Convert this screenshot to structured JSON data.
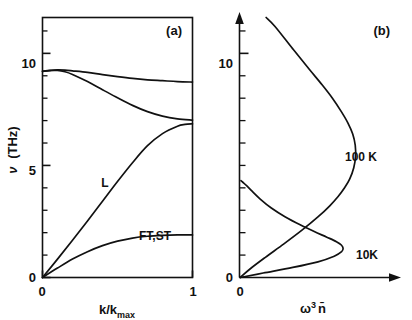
{
  "figure": {
    "background": "#ffffff",
    "ink": "#111111",
    "width": 412,
    "height": 320
  },
  "panel_a": {
    "label": "(a)",
    "xlabel_main": "k/k",
    "xlabel_sub": "max",
    "ylabel_symbol": "ν",
    "ylabel_unit": "(THz)",
    "x_ticks": [
      "0",
      "1"
    ],
    "y_ticks": [
      "0",
      "5",
      "10"
    ],
    "curve_labels": {
      "longitudinal": "L",
      "transverse": "FT,ST"
    },
    "chart_data": {
      "type": "line",
      "title": "(a) Phonon dispersion",
      "xlabel": "k/k_max",
      "ylabel": "ν (THz)",
      "xlim": [
        0,
        1
      ],
      "ylim": [
        0,
        11.6
      ],
      "grid": false,
      "legend": "inline-annotations",
      "y_major_ticks": [
        0,
        5,
        10
      ],
      "y_minor_tick_step": 1,
      "x_tick_values": [
        0,
        1
      ],
      "series": [
        {
          "name": "optic-upper",
          "label": "",
          "x": [
            0.0,
            0.05,
            0.1,
            0.15,
            0.2,
            0.3,
            0.4,
            0.5,
            0.6,
            0.7,
            0.8,
            0.9,
            1.0
          ],
          "y": [
            9.2,
            9.24,
            9.26,
            9.25,
            9.22,
            9.15,
            9.05,
            8.96,
            8.88,
            8.82,
            8.78,
            8.74,
            8.72
          ]
        },
        {
          "name": "optic-lower",
          "label": "",
          "x": [
            0.0,
            0.05,
            0.1,
            0.15,
            0.2,
            0.3,
            0.4,
            0.5,
            0.6,
            0.7,
            0.8,
            0.9,
            1.0
          ],
          "y": [
            9.2,
            9.23,
            9.24,
            9.18,
            9.06,
            8.74,
            8.38,
            8.02,
            7.68,
            7.4,
            7.2,
            7.08,
            7.02
          ]
        },
        {
          "name": "longitudinal-acoustic",
          "label": "L",
          "x": [
            0.0,
            0.1,
            0.2,
            0.3,
            0.4,
            0.5,
            0.6,
            0.7,
            0.8,
            0.9,
            0.95,
            1.0
          ],
          "y": [
            0.0,
            0.82,
            1.66,
            2.52,
            3.4,
            4.28,
            5.12,
            5.88,
            6.42,
            6.75,
            6.83,
            6.86
          ]
        },
        {
          "name": "transverse-acoustic",
          "label": "FT,ST",
          "x": [
            0.0,
            0.1,
            0.2,
            0.3,
            0.4,
            0.5,
            0.6,
            0.7,
            0.8,
            0.9,
            1.0
          ],
          "y": [
            0.0,
            0.42,
            0.82,
            1.15,
            1.42,
            1.62,
            1.76,
            1.84,
            1.88,
            1.9,
            1.9
          ]
        }
      ]
    }
  },
  "panel_b": {
    "label": "(b)",
    "xlabel_symbol": "ω",
    "xlabel_sup": "3",
    "xlabel_bar": "n̄",
    "x_ticks": [
      "0"
    ],
    "y_ticks": [
      "0",
      "10"
    ],
    "curve_labels": {
      "hot": "100 K",
      "cold": "10K"
    },
    "chart_data": {
      "type": "line",
      "title": "(b) Spectral phonon occupation",
      "xlabel": "ω³ n̄",
      "ylabel": "ν (THz)",
      "xlim": [
        0,
        1.0
      ],
      "ylim": [
        0,
        11.6
      ],
      "grid": false,
      "legend": "inline-annotations",
      "y_major_ticks": [
        0,
        10
      ],
      "y_minor_tick_step": 1,
      "series": [
        {
          "name": "100K",
          "label": "100 K",
          "y": [
            0.0,
            0.4,
            0.9,
            1.5,
            2.1,
            2.7,
            3.2,
            3.6,
            4.0,
            4.4,
            4.9,
            5.4,
            5.9,
            6.4,
            6.9,
            7.4,
            8.0,
            8.6,
            9.3,
            10.2,
            11.2,
            11.6
          ],
          "x": [
            0.005,
            0.075,
            0.175,
            0.3,
            0.42,
            0.53,
            0.61,
            0.665,
            0.71,
            0.745,
            0.772,
            0.784,
            0.782,
            0.765,
            0.732,
            0.688,
            0.628,
            0.558,
            0.47,
            0.36,
            0.24,
            0.18
          ]
        },
        {
          "name": "10K",
          "label": "10K",
          "y": [
            0.0,
            0.2,
            0.45,
            0.7,
            0.95,
            1.15,
            1.3,
            1.45,
            1.6,
            1.8,
            2.05,
            2.35,
            2.7,
            3.1,
            3.5,
            3.85,
            4.1,
            4.25,
            4.32
          ],
          "x": [
            0.005,
            0.16,
            0.36,
            0.53,
            0.64,
            0.69,
            0.7,
            0.688,
            0.655,
            0.59,
            0.505,
            0.41,
            0.31,
            0.215,
            0.14,
            0.085,
            0.048,
            0.022,
            0.01
          ]
        }
      ]
    }
  }
}
